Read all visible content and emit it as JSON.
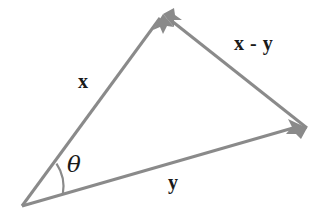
{
  "figure": {
    "background_color": "#ffffff",
    "stroke_color": "#8a8a8a",
    "text_color": "#1a1a1a",
    "stroke_width": 3,
    "width": 320,
    "height": 219
  },
  "labels": {
    "x": "x",
    "y": "y",
    "x_minus_y": "x - y",
    "theta": "θ"
  },
  "geometry": {
    "origin": {
      "x": 22,
      "y": 206
    },
    "apex": {
      "x": 163,
      "y": 14
    },
    "right_vertex": {
      "x": 307,
      "y": 128
    },
    "angle_arc_radius": 42,
    "vectors": [
      {
        "name": "x",
        "from": "origin",
        "to": "apex",
        "arrowhead": "to",
        "label": "x"
      },
      {
        "name": "y",
        "from": "origin",
        "to": "right_vertex",
        "arrowhead": "to",
        "label": "y"
      },
      {
        "name": "x-minus-y",
        "from": "right_vertex",
        "to": "apex",
        "arrowhead": "to",
        "label": "x - y"
      }
    ]
  }
}
